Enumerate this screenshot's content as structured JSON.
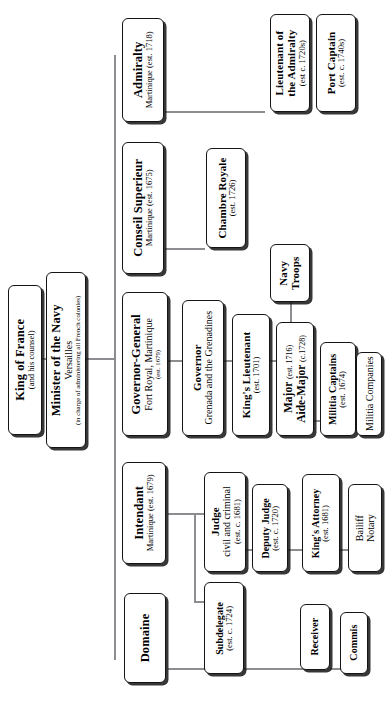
{
  "diagram": {
    "type": "organizational-hierarchy",
    "orientation": "rotated-90-counterclockwise",
    "accent_line_color": "#8b8d90",
    "box_border_color": "#141414",
    "background_color": "#ffffff",
    "nodes": [
      {
        "id": "king-of-france",
        "title": "King of France",
        "subtitle": "(and his counsel)",
        "subtitle2": "",
        "level": 0
      },
      {
        "id": "minister-of-the-navy",
        "title": "Minister of the Navy",
        "subtitle": "Versailles",
        "subtitle2": "(in charge of administering all French colonies)",
        "level": 1
      },
      {
        "id": "admiralty",
        "title": "Admiralty",
        "subtitle": "Martinique (est. 1718)",
        "subtitle2": "",
        "level": 2
      },
      {
        "id": "conseil-superieur",
        "title": "Conseil Superieur",
        "subtitle": "Martinique (est. 1675)",
        "subtitle2": "",
        "level": 2
      },
      {
        "id": "governor-general",
        "title": "Governor-General",
        "subtitle": "Fort Royal, Martinique",
        "subtitle2": "(est. 1679)",
        "level": 2
      },
      {
        "id": "intendant",
        "title": "Intendant",
        "subtitle": "Martinique (est. 1679)",
        "subtitle2": "",
        "level": 2
      },
      {
        "id": "domaine",
        "title": "Domaine",
        "subtitle": "",
        "subtitle2": "",
        "level": 2
      },
      {
        "id": "lieutenant-of-the-admiralty",
        "title": "Lieutenant of the Admiralty",
        "title_line1": "Lieutenant of",
        "title_line2": "the Admiralty",
        "subtitle": "(est c. 1720s)",
        "subtitle2": "",
        "level": 3
      },
      {
        "id": "port-captain",
        "title": "Port Captain",
        "subtitle": "(est. c. 1740s)",
        "subtitle2": "",
        "level": 3
      },
      {
        "id": "chambre-royale",
        "title": "Chambre Royale",
        "subtitle": "(est. 1726)",
        "subtitle2": "",
        "level": 3
      },
      {
        "id": "governor-grenada",
        "title": "Governor",
        "subtitle": "Grenada and the Grenadines",
        "subtitle2": "",
        "level": 3
      },
      {
        "id": "kings-lieutenant",
        "title": "King's Lieutenant",
        "subtitle": "(est. 1701)",
        "subtitle2": "",
        "level": 4
      },
      {
        "id": "major-aide-major",
        "title": "Major",
        "title_sub": "(est. 1716)",
        "title2": "Aide-Major",
        "title2_sub": "(c.1728)",
        "level": 4
      },
      {
        "id": "navy-troops",
        "title": "Navy",
        "title_line2": "Troops",
        "subtitle": "",
        "subtitle2": "",
        "level": 5
      },
      {
        "id": "militia-captains",
        "title": "Militia Captains",
        "subtitle": "(est. 1674)",
        "subtitle2": "",
        "level": 5
      },
      {
        "id": "militia-companies",
        "title": "Militia Companies",
        "subtitle": "",
        "subtitle2": "",
        "level": 6
      },
      {
        "id": "judge",
        "title": "Judge",
        "subtitle": "civil and criminal",
        "subtitle2": "(est. c. 1681)",
        "level": 3
      },
      {
        "id": "deputy-judge",
        "title": "Deputy Judge",
        "subtitle": "(est. c. 1720)",
        "subtitle2": "",
        "level": 4
      },
      {
        "id": "kings-attorney",
        "title": "King's Attorney",
        "subtitle": "(est. 1681)",
        "subtitle2": "",
        "level": 4
      },
      {
        "id": "bailiff-notary",
        "title": "Bailiff",
        "title_line2": "Notary",
        "subtitle": "",
        "subtitle2": "",
        "level": 5
      },
      {
        "id": "subdelegate",
        "title": "Subdelegate",
        "subtitle": "(est. c. 1724)",
        "subtitle2": "",
        "level": 3
      },
      {
        "id": "receiver",
        "title": "Receiver",
        "subtitle": "",
        "subtitle2": "",
        "level": 3
      },
      {
        "id": "commis",
        "title": "Commis",
        "subtitle": "",
        "subtitle2": "",
        "level": 4
      }
    ]
  }
}
